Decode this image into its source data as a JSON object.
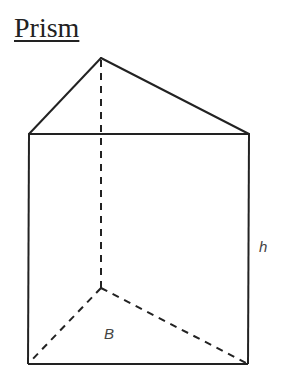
{
  "title": "Prism",
  "labels": {
    "height": "h",
    "base": "B"
  },
  "colors": {
    "stroke": "#222222",
    "label": "#444444",
    "background": "#ffffff"
  },
  "figure": {
    "type": "triangular-prism",
    "vertices": {
      "top_back": [
        101,
        58
      ],
      "top_front_left": [
        29,
        134
      ],
      "top_front_right": [
        249,
        134
      ],
      "bottom_back": [
        101,
        288
      ],
      "bottom_front_left": [
        28,
        364
      ],
      "bottom_front_right": [
        248,
        364
      ]
    }
  }
}
